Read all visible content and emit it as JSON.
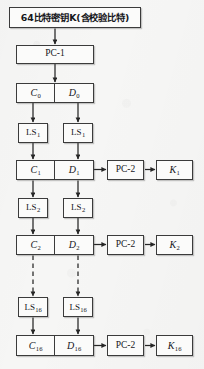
{
  "figure": {
    "type": "flowchart",
    "background_color": "#f6f6f5",
    "line_color": "#3b3b3b",
    "box_fill": "#fbfbfa"
  },
  "nodes": {
    "key_input": {
      "label": "64比特密钥K(含校验比特)"
    },
    "pc1": {
      "label": "PC-1"
    },
    "round0": {
      "left": "C",
      "left_sub": "0",
      "right": "D",
      "right_sub": "0"
    },
    "ls1_left": {
      "label": "LS",
      "sub": "1"
    },
    "ls1_right": {
      "label": "LS",
      "sub": "1"
    },
    "round1": {
      "left": "C",
      "left_sub": "1",
      "right": "D",
      "right_sub": "1"
    },
    "pc2_1": {
      "label": "PC-2"
    },
    "k1": {
      "label": "K",
      "sub": "1"
    },
    "ls2_left": {
      "label": "LS",
      "sub": "2"
    },
    "ls2_right": {
      "label": "LS",
      "sub": "2"
    },
    "round2": {
      "left": "C",
      "left_sub": "2",
      "right": "D",
      "right_sub": "2"
    },
    "pc2_2": {
      "label": "PC-2"
    },
    "k2": {
      "label": "K",
      "sub": "2"
    },
    "ls16_left": {
      "label": "LS",
      "sub": "16"
    },
    "ls16_right": {
      "label": "LS",
      "sub": "16"
    },
    "round16": {
      "left": "C",
      "left_sub": "16",
      "right": "D",
      "right_sub": "16"
    },
    "pc2_16": {
      "label": "PC-2"
    },
    "k16": {
      "label": "K",
      "sub": "16"
    }
  }
}
